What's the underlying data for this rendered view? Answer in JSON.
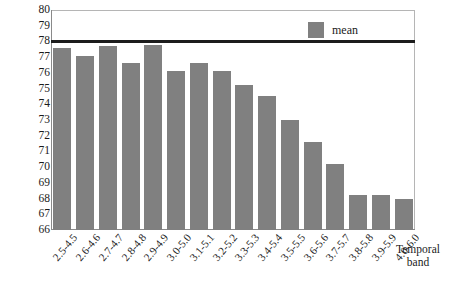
{
  "chart_data": {
    "type": "bar",
    "title": "",
    "xlabel": "Temporal band",
    "ylabel": "",
    "ylim": [
      66,
      80
    ],
    "yticks": [
      66,
      67,
      68,
      69,
      70,
      71,
      72,
      73,
      74,
      75,
      76,
      77,
      78,
      79,
      80
    ],
    "grid": false,
    "legend": {
      "position": "top-right",
      "entries": [
        {
          "name": "mean",
          "color": "#808080"
        }
      ]
    },
    "reference_line": {
      "value": 78,
      "color": "#1c1c1c"
    },
    "categories": [
      "2.5-4.5",
      "2.6-4.6",
      "2.7-4.7",
      "2.8-4.8",
      "2.9-4.9",
      "3.0-5.0",
      "3.1-5.1",
      "3.2-5.2",
      "3.3-5.3",
      "3.4-5.4",
      "3.5-5.5",
      "3.6-5.6",
      "3.7-5.7",
      "3.8-5.8",
      "3.9-5.9",
      "4.0-6.0"
    ],
    "series": [
      {
        "name": "mean",
        "color": "#808080",
        "values": [
          77.6,
          77.1,
          77.7,
          76.6,
          77.8,
          76.1,
          76.6,
          76.1,
          75.2,
          74.5,
          73.0,
          71.6,
          70.2,
          68.2,
          68.2,
          68.0
        ]
      }
    ]
  },
  "axis_title": {
    "line1": "Temporal",
    "line2": "band"
  }
}
